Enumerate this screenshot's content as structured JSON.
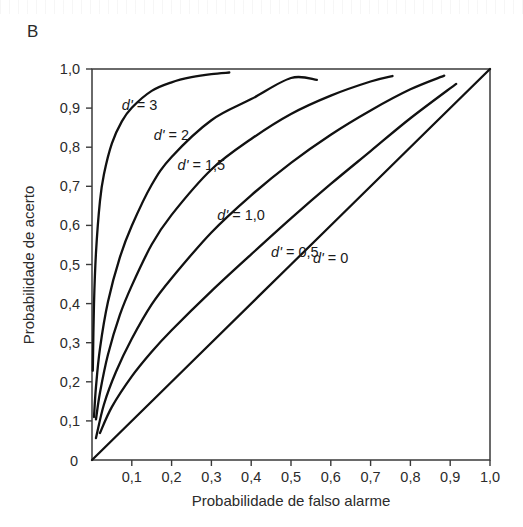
{
  "panel": {
    "label": "B"
  },
  "chart_data": {
    "type": "line",
    "title": "",
    "subtitle": "",
    "xlabel": "Probabilidade de falso alarme",
    "ylabel": "Probabilidade de acerto",
    "xlim": [
      0,
      1
    ],
    "ylim": [
      0,
      1
    ],
    "grid": false,
    "legend_position": "inline-annotations",
    "decimal_separator": ",",
    "xticks": [
      0,
      0.1,
      0.2,
      0.3,
      0.4,
      0.5,
      0.6,
      0.7,
      0.8,
      0.9,
      1.0
    ],
    "xticklabels": [
      "0",
      "0,1",
      "0,2",
      "0,3",
      "0,4",
      "0,5",
      "0,6",
      "0,7",
      "0,8",
      "0,9",
      "1,0"
    ],
    "yticks": [
      0,
      0.1,
      0.2,
      0.3,
      0.4,
      0.5,
      0.6,
      0.7,
      0.8,
      0.9,
      1.0
    ],
    "yticklabels": [
      "0",
      "0,1",
      "0,2",
      "0,3",
      "0,4",
      "0,5",
      "0,6",
      "0,7",
      "0,8",
      "0,9",
      "1,0"
    ],
    "curve_model": "roc_isosensitivity: hit = Phi(Phi^-1(fa) + d')",
    "series": [
      {
        "name": "d' = 3",
        "dprime": 3,
        "label": "d' = 3",
        "label_x": 0.075,
        "label_y": 0.895,
        "x_end": 0.345,
        "x": [
          0.002,
          0.005,
          0.01,
          0.02,
          0.03,
          0.05,
          0.075,
          0.1,
          0.15,
          0.2,
          0.25,
          0.3,
          0.345
        ],
        "y": [
          0.228,
          0.399,
          0.53,
          0.662,
          0.731,
          0.81,
          0.866,
          0.901,
          0.944,
          0.966,
          0.979,
          0.987,
          0.991
        ]
      },
      {
        "name": "d' = 2",
        "dprime": 2,
        "label": "d' = 2",
        "label_x": 0.155,
        "label_y": 0.818,
        "x_end": 0.565,
        "x": [
          0.005,
          0.01,
          0.02,
          0.04,
          0.07,
          0.1,
          0.15,
          0.2,
          0.3,
          0.4,
          0.5,
          0.565
        ],
        "y": [
          0.11,
          0.187,
          0.285,
          0.404,
          0.518,
          0.599,
          0.704,
          0.775,
          0.869,
          0.923,
          0.977,
          0.972
        ]
      },
      {
        "name": "d' = 1,5",
        "dprime": 1.5,
        "label": "d' = 1,5",
        "label_x": 0.215,
        "label_y": 0.742,
        "x_end": 0.755,
        "x": [
          0.01,
          0.02,
          0.04,
          0.07,
          0.1,
          0.15,
          0.2,
          0.3,
          0.4,
          0.5,
          0.6,
          0.7,
          0.755
        ],
        "y": [
          0.104,
          0.172,
          0.269,
          0.371,
          0.446,
          0.551,
          0.627,
          0.743,
          0.821,
          0.885,
          0.932,
          0.968,
          0.982
        ]
      },
      {
        "name": "d' = 1,0",
        "dprime": 1.0,
        "label": "d' = 1,0",
        "label_x": 0.315,
        "label_y": 0.614,
        "x_end": 0.885,
        "x": [
          0.01,
          0.03,
          0.06,
          0.1,
          0.15,
          0.2,
          0.3,
          0.4,
          0.5,
          0.6,
          0.7,
          0.8,
          0.885
        ],
        "y": [
          0.056,
          0.142,
          0.225,
          0.31,
          0.398,
          0.465,
          0.582,
          0.677,
          0.76,
          0.832,
          0.894,
          0.948,
          0.983
        ]
      },
      {
        "name": "d' = 0,5",
        "dprime": 0.5,
        "label": "d' = 0,5",
        "label_x": 0.45,
        "label_y": 0.518,
        "x_end": 0.915,
        "x": [
          0.02,
          0.05,
          0.1,
          0.15,
          0.2,
          0.3,
          0.4,
          0.5,
          0.6,
          0.7,
          0.8,
          0.915
        ],
        "y": [
          0.069,
          0.136,
          0.214,
          0.277,
          0.332,
          0.432,
          0.526,
          0.618,
          0.706,
          0.79,
          0.874,
          0.962
        ]
      },
      {
        "name": "d' = 0",
        "dprime": 0,
        "label": "d' = 0",
        "label_x": 0.555,
        "label_y": 0.505,
        "x_end": 1.0,
        "x": [
          0,
          0.25,
          0.5,
          0.75,
          1.0
        ],
        "y": [
          0,
          0.25,
          0.5,
          0.75,
          1.0
        ]
      }
    ]
  },
  "colors": {
    "curve": "#111111",
    "axis": "#3a3a3a",
    "text": "#2b2b2b",
    "background": "#ffffff"
  }
}
